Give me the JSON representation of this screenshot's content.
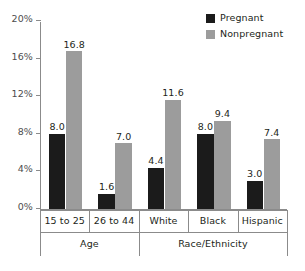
{
  "chart_data": {
    "type": "bar",
    "title": "",
    "subtitle": "",
    "xlabel": "",
    "ylabel": "",
    "ylim": [
      0,
      20
    ],
    "ytick_labels": [
      "0%",
      "4%",
      "8%",
      "12%",
      "16%",
      "20%"
    ],
    "ytick_values": [
      0,
      4,
      8,
      12,
      16,
      20
    ],
    "grid": false,
    "legend_position": "top-right",
    "categories": [
      "15 to 25",
      "26 to 44",
      "White",
      "Black",
      "Hispanic"
    ],
    "group_labels": [
      "Age",
      "Race/Ethnicity"
    ],
    "groups": [
      {
        "label": "Age",
        "categories": [
          "15 to 25",
          "26 to 44"
        ]
      },
      {
        "label": "Race/Ethnicity",
        "categories": [
          "White",
          "Black",
          "Hispanic"
        ]
      }
    ],
    "series": [
      {
        "name": "Pregnant",
        "color": "#1b1b1b",
        "values": [
          8.0,
          1.6,
          4.4,
          8.0,
          3.0
        ],
        "value_labels": [
          "8.0",
          "1.6",
          "4.4",
          "8.0",
          "3.0"
        ]
      },
      {
        "name": "Nonpregnant",
        "color": "#9c9c9c",
        "values": [
          16.8,
          7.0,
          11.6,
          9.4,
          7.4
        ],
        "value_labels": [
          "16.8",
          "7.0",
          "11.6",
          "9.4",
          "7.4"
        ]
      }
    ]
  },
  "legend": {
    "items": [
      {
        "label": "Pregnant",
        "color": "#1b1b1b"
      },
      {
        "label": "Nonpregnant",
        "color": "#9c9c9c"
      }
    ]
  },
  "axis": {
    "y_ticks": [
      {
        "label": "20%",
        "value": 20
      },
      {
        "label": "16%",
        "value": 16
      },
      {
        "label": "12%",
        "value": 12
      },
      {
        "label": "8%",
        "value": 8
      },
      {
        "label": "4%",
        "value": 4
      },
      {
        "label": "0%",
        "value": 0
      }
    ]
  },
  "colors": {
    "pregnant": "#1b1b1b",
    "nonpregnant": "#9c9c9c",
    "axis": "#8b8b8b",
    "text": "#231f20",
    "tick_text": "#4d4d4d",
    "background": "#ffffff"
  }
}
